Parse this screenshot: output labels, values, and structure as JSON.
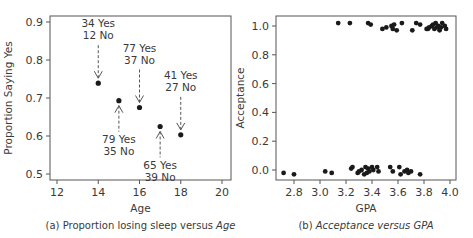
{
  "chart_data": [
    {
      "type": "scatter",
      "caption": "(a) Proportion losing sleep versus Age",
      "caption_prefix": "(a) Proportion losing sleep versus ",
      "caption_italic": "Age",
      "xlabel": "Age",
      "ylabel": "Proportion Saying Yes",
      "xlim": [
        11.7,
        20.4
      ],
      "ylim": [
        0.48,
        0.915
      ],
      "xticks": [
        12,
        14,
        16,
        18,
        20
      ],
      "yticks": [
        0.5,
        0.6,
        0.7,
        0.8,
        0.9
      ],
      "ytick_labels": [
        "0.5",
        "0.6",
        "0.7",
        "0.8",
        "0.9"
      ],
      "grid": false,
      "points": [
        {
          "x": 14,
          "y": 0.739,
          "yes": 34,
          "no": 12,
          "label_yes": "34 Yes",
          "label_no": "12 No",
          "label_pos": "above"
        },
        {
          "x": 15,
          "y": 0.693,
          "yes": 79,
          "no": 35,
          "label_yes": "79 Yes",
          "label_no": "35 No",
          "label_pos": "below"
        },
        {
          "x": 16,
          "y": 0.675,
          "yes": 77,
          "no": 37,
          "label_yes": "77 Yes",
          "label_no": "37 No",
          "label_pos": "above"
        },
        {
          "x": 17,
          "y": 0.625,
          "yes": 65,
          "no": 39,
          "label_yes": "65 Yes",
          "label_no": "39 No",
          "label_pos": "below"
        },
        {
          "x": 18,
          "y": 0.603,
          "yes": 41,
          "no": 27,
          "label_yes": "41 Yes",
          "label_no": "27 No",
          "label_pos": "above"
        }
      ]
    },
    {
      "type": "scatter",
      "caption": "(b) Acceptance versus GPA",
      "caption_prefix": "(b) ",
      "caption_italic": "Acceptance versus GPA",
      "xlabel": "GPA",
      "ylabel": "Acceptance",
      "xlim": [
        2.69,
        4.04
      ],
      "ylim": [
        -0.07,
        1.07
      ],
      "xticks": [
        2.8,
        3.0,
        3.2,
        3.4,
        3.6,
        3.8,
        4.0
      ],
      "xtick_labels": [
        "2.8",
        "3.0",
        "3.2",
        "3.4",
        "3.6",
        "3.8",
        "4.0"
      ],
      "yticks": [
        0.0,
        0.2,
        0.4,
        0.6,
        0.8,
        1.0
      ],
      "ytick_labels": [
        "0.0",
        "0.2",
        "0.4",
        "0.6",
        "0.8",
        "1.0"
      ],
      "grid": false,
      "jittered": true,
      "accepted_gpa": [
        3.14,
        3.23,
        3.37,
        3.39,
        3.48,
        3.51,
        3.55,
        3.56,
        3.57,
        3.59,
        3.63,
        3.71,
        3.74,
        3.77,
        3.82,
        3.83,
        3.84,
        3.86,
        3.87,
        3.88,
        3.89,
        3.9,
        3.91,
        3.92,
        3.93,
        3.94,
        3.96,
        3.97
      ],
      "accepted_y": [
        1.02,
        1.02,
        1.02,
        1.01,
        0.98,
        0.99,
        1.0,
        0.98,
        1.01,
        0.97,
        1.02,
        0.97,
        1.02,
        1.01,
        0.98,
        0.98,
        0.99,
        1.0,
        1.01,
        0.98,
        1.02,
        0.99,
        1.0,
        0.97,
        0.99,
        1.02,
        1.0,
        0.98
      ],
      "rejected_gpa": [
        2.72,
        2.8,
        3.04,
        3.09,
        3.24,
        3.25,
        3.29,
        3.3,
        3.32,
        3.34,
        3.35,
        3.36,
        3.37,
        3.38,
        3.4,
        3.41,
        3.44,
        3.45,
        3.54,
        3.56,
        3.61,
        3.62,
        3.65,
        3.67,
        3.68,
        3.7,
        3.77
      ],
      "rejected_y": [
        -0.02,
        -0.03,
        -0.01,
        -0.02,
        0.01,
        0.02,
        -0.02,
        -0.01,
        0.0,
        -0.03,
        0.02,
        -0.02,
        0.01,
        -0.01,
        0.02,
        0.0,
        0.02,
        -0.01,
        0.02,
        -0.01,
        0.02,
        -0.03,
        -0.01,
        0.0,
        -0.02,
        -0.01,
        -0.03
      ]
    }
  ]
}
